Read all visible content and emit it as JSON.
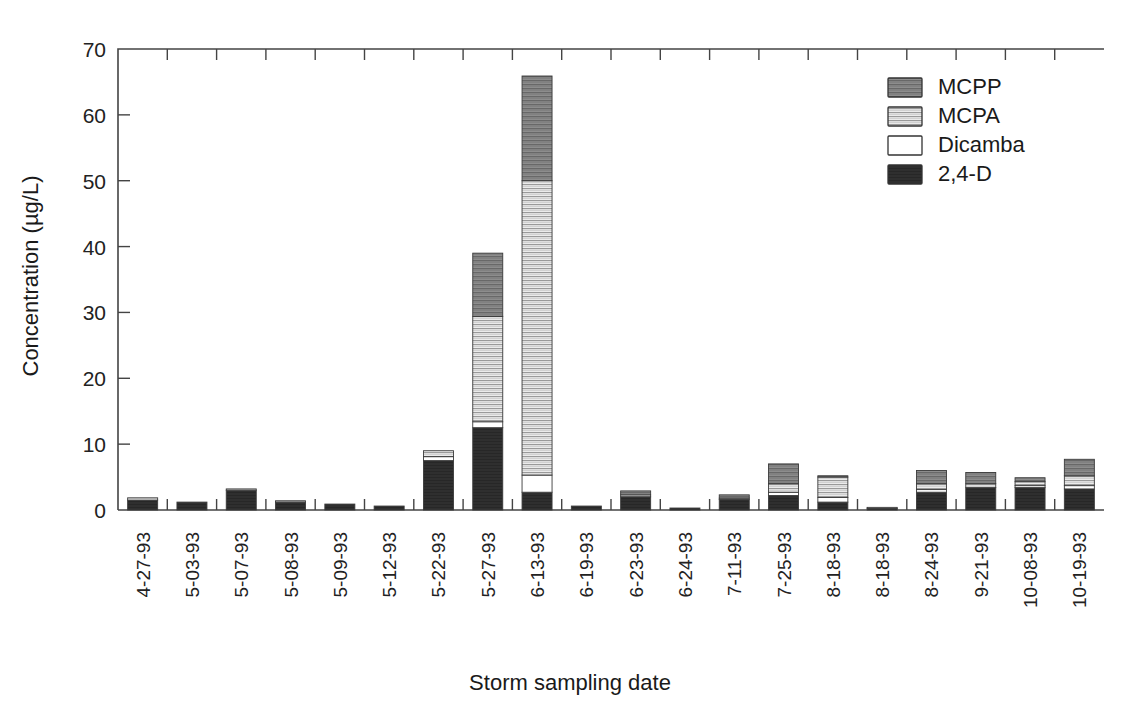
{
  "chart_data": {
    "type": "bar",
    "subtype": "stacked-bar",
    "title": "",
    "xlabel": "Storm sampling date",
    "ylabel": "Concentration (µg/L)",
    "ylim": [
      0,
      70
    ],
    "yticks": [
      0,
      10,
      20,
      30,
      40,
      50,
      60,
      70
    ],
    "ytick_labels": [
      "0",
      "10",
      "20",
      "30",
      "40",
      "50",
      "60",
      "70"
    ],
    "grid": false,
    "legend_position": "top-right",
    "legend_order_top_to_bottom": [
      "MCPP",
      "MCPA",
      "Dicamba",
      "2,4-D"
    ],
    "stack_order_bottom_to_top": [
      "2,4-D",
      "Dicamba",
      "MCPA",
      "MCPP"
    ],
    "categories": [
      "4-27-93",
      "5-03-93",
      "5-07-93",
      "5-08-93",
      "5-09-93",
      "5-12-93",
      "5-22-93",
      "5-27-93",
      "6-13-93",
      "6-19-93",
      "6-23-93",
      "6-24-93",
      "7-11-93",
      "7-25-93",
      "8-18-93",
      "8-18-93",
      "8-24-93",
      "9-21-93",
      "10-08-93",
      "10-19-93"
    ],
    "series": [
      {
        "name": "2,4-D",
        "color": "#2b2b2b",
        "pattern": "solid-dark",
        "values": [
          1.5,
          1.2,
          3.0,
          1.2,
          0.9,
          0.6,
          7.5,
          12.5,
          2.7,
          0.6,
          2.0,
          0.3,
          1.6,
          2.2,
          1.2,
          0.3,
          2.7,
          3.4,
          3.4,
          3.2
        ]
      },
      {
        "name": "Dicamba",
        "color": "#ffffff",
        "pattern": "plain-white",
        "values": [
          0.0,
          0.0,
          0.0,
          0.0,
          0.0,
          0.0,
          0.6,
          0.9,
          2.6,
          0.0,
          0.0,
          0.0,
          0.0,
          0.5,
          0.7,
          0.0,
          0.4,
          0.0,
          0.3,
          0.5
        ]
      },
      {
        "name": "MCPA",
        "color": "#d9d9d9",
        "pattern": "light-hatch",
        "values": [
          0.35,
          0.0,
          0.2,
          0.2,
          0.0,
          0.0,
          0.9,
          16.0,
          44.7,
          0.0,
          0.3,
          0.0,
          0.2,
          1.3,
          3.1,
          0.1,
          0.9,
          0.6,
          0.6,
          1.5
        ]
      },
      {
        "name": "MCPP",
        "color": "#8a8a8a",
        "pattern": "dark-hatch",
        "values": [
          0.0,
          0.0,
          0.0,
          0.0,
          0.0,
          0.0,
          0.0,
          9.6,
          15.9,
          0.0,
          0.6,
          0.0,
          0.5,
          3.0,
          0.2,
          0.0,
          2.0,
          1.7,
          0.6,
          2.5
        ]
      }
    ],
    "totals": [
      1.85,
      1.2,
      3.2,
      1.4,
      0.9,
      0.6,
      9.0,
      39.0,
      65.9,
      0.6,
      2.9,
      0.3,
      2.3,
      7.0,
      5.2,
      0.4,
      6.0,
      5.7,
      4.9,
      7.7
    ]
  },
  "legend": {
    "entries": [
      {
        "label": "MCPP"
      },
      {
        "label": "MCPA"
      },
      {
        "label": "Dicamba"
      },
      {
        "label": "2,4-D"
      }
    ]
  },
  "colors": {
    "axis": "#444444",
    "text": "#1a1a1a",
    "background": "#ffffff",
    "mcpp": "#8a8a8a",
    "mcpa": "#d9d9d9",
    "dicamba": "#ffffff",
    "twofourd": "#2b2b2b"
  }
}
